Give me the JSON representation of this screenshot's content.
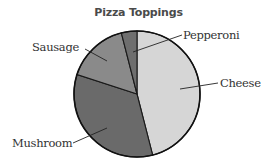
{
  "chart_data": {
    "type": "pie",
    "title": "Pizza Toppings",
    "categories": [
      "Cheese",
      "Mushroom",
      "Sausage",
      "Pepperoni"
    ],
    "values": [
      46,
      34,
      16,
      4
    ],
    "unit": "percent (estimated from slice angles; no values labeled)",
    "colors": [
      "#d6d6d6",
      "#6a6a6a",
      "#8a8a8a",
      "#6e6e6e"
    ],
    "start_angle": "12 o'clock",
    "direction": "clockwise",
    "labels_shown": true,
    "legend": "none (callout labels with leader lines)"
  },
  "labels": {
    "title": "Pizza Toppings",
    "cheese": "Cheese",
    "mushroom": "Mushroom",
    "sausage": "Sausage",
    "pepperoni": "Pepperoni"
  }
}
